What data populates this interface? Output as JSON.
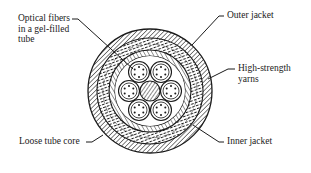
{
  "diagram": {
    "type": "cross-section",
    "labels": {
      "optical_fibers": [
        "Optical fibers",
        "in a gel-filled",
        "tube"
      ],
      "outer_jacket": "Outer jacket",
      "high_strength_yarns": [
        "High-strength",
        "yarns"
      ],
      "inner_jacket": "Inner jacket",
      "loose_tube_core": "Loose tube core"
    },
    "structure": {
      "layers_outer_to_inner": [
        "Outer jacket",
        "High-strength yarns",
        "Inner jacket",
        "Loose tube core"
      ],
      "tube_count": 6,
      "fibers_per_tube": 6,
      "central_member": true
    },
    "colors": {
      "ink": "#1a1a1a",
      "background": "#ffffff"
    }
  }
}
